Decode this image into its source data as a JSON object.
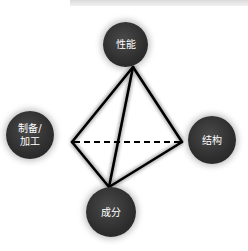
{
  "diagram": {
    "type": "materials-tetrahedron",
    "nodes": {
      "top": "性能",
      "left": "制备/\n加工",
      "right": "结构",
      "bottom": "成分"
    },
    "edges": [
      {
        "from": "apex",
        "to": "left-vertex",
        "style": "solid"
      },
      {
        "from": "apex",
        "to": "right-vertex",
        "style": "solid"
      },
      {
        "from": "apex",
        "to": "bottom-vertex",
        "style": "solid"
      },
      {
        "from": "left-vertex",
        "to": "bottom-vertex",
        "style": "solid"
      },
      {
        "from": "right-vertex",
        "to": "bottom-vertex",
        "style": "solid"
      },
      {
        "from": "left-vertex",
        "to": "right-vertex",
        "style": "dashed"
      }
    ],
    "colors": {
      "node_fill": "#333333",
      "node_text": "#ffffff",
      "edge": "#000000"
    }
  }
}
